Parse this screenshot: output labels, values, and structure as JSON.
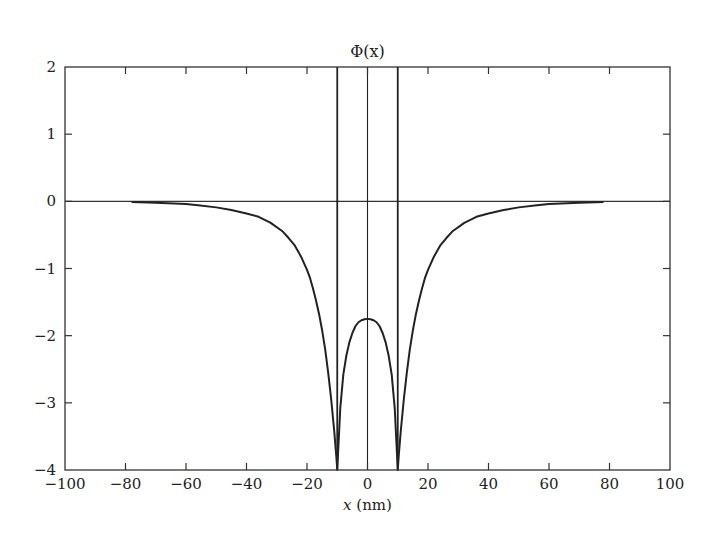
{
  "chart_data": {
    "type": "line",
    "title": "Φ(x)",
    "xlabel": "x (nm)",
    "ylabel": "",
    "xlim": [
      -100,
      100
    ],
    "ylim": [
      -4,
      2
    ],
    "xticks": [
      -100,
      -80,
      -60,
      -40,
      -20,
      0,
      20,
      40,
      60,
      80,
      100
    ],
    "xtick_labels": [
      "−100",
      "−80",
      "−60",
      "−40",
      "−20",
      "0",
      "20",
      "40",
      "60",
      "80",
      "100"
    ],
    "yticks": [
      2,
      1,
      0,
      -1,
      -2,
      -3,
      -4
    ],
    "ytick_labels": [
      "2",
      "1",
      "0",
      "−1",
      "−2",
      "−3",
      "−4"
    ],
    "grid": false,
    "legend": null,
    "reference_lines": {
      "horizontal": [
        0
      ],
      "vertical": [
        -10,
        0,
        10
      ]
    },
    "series": [
      {
        "name": "Φ(x)",
        "color": "#222222",
        "x": [
          -78,
          -70,
          -60,
          -56,
          -50,
          -45,
          -40,
          -36,
          -32,
          -28,
          -26,
          -24,
          -22,
          -20,
          -19,
          -18,
          -17,
          -16,
          -15,
          -14,
          -13,
          -12,
          -11,
          -10.3,
          -10,
          -9.7,
          -9,
          -8,
          -7,
          -6,
          -5,
          -4,
          -3,
          -2,
          -1,
          0,
          1,
          2,
          3,
          4,
          5,
          6,
          7,
          8,
          9,
          9.7,
          10,
          10.3,
          11,
          12,
          13,
          14,
          15,
          16,
          17,
          18,
          19,
          20,
          22,
          24,
          26,
          28,
          32,
          36,
          40,
          45,
          50,
          56,
          60,
          70,
          78
        ],
        "y": [
          -0.01,
          -0.02,
          -0.04,
          -0.06,
          -0.09,
          -0.13,
          -0.18,
          -0.23,
          -0.32,
          -0.45,
          -0.55,
          -0.66,
          -0.82,
          -1.02,
          -1.14,
          -1.3,
          -1.48,
          -1.68,
          -1.92,
          -2.2,
          -2.55,
          -2.95,
          -3.42,
          -3.8,
          -4.0,
          -3.72,
          -3.08,
          -2.58,
          -2.3,
          -2.1,
          -1.96,
          -1.86,
          -1.8,
          -1.77,
          -1.755,
          -1.75,
          -1.755,
          -1.77,
          -1.8,
          -1.86,
          -1.96,
          -2.1,
          -2.3,
          -2.58,
          -3.08,
          -3.72,
          -4.0,
          -3.8,
          -3.42,
          -2.95,
          -2.55,
          -2.2,
          -1.92,
          -1.68,
          -1.48,
          -1.3,
          -1.14,
          -1.02,
          -0.82,
          -0.66,
          -0.55,
          -0.45,
          -0.32,
          -0.23,
          -0.18,
          -0.13,
          -0.09,
          -0.06,
          -0.04,
          -0.02,
          -0.01
        ]
      }
    ]
  },
  "layout": {
    "plot_left": 65,
    "plot_right": 670,
    "plot_top": 67,
    "plot_bottom": 470,
    "line_color": "#222222",
    "frame_color": "#333333"
  }
}
